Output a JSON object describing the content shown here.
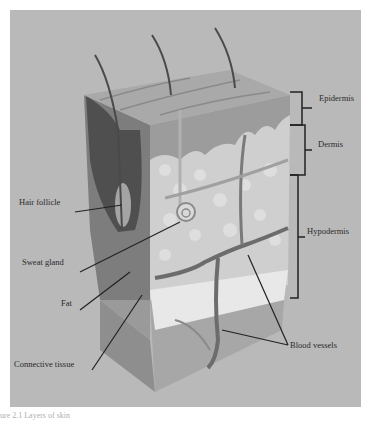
{
  "figure": {
    "caption": "ure 2.1 Layers of skin",
    "background_color": "#b9b9b9",
    "layers": [
      {
        "label": "Epidermis"
      },
      {
        "label": "Dermis"
      },
      {
        "label": "Hypodermis"
      }
    ],
    "structures": [
      {
        "label": "Hair follicle"
      },
      {
        "label": "Sweat gland"
      },
      {
        "label": "Fat"
      },
      {
        "label": "Connective tissue"
      },
      {
        "label": "Blood vessels"
      }
    ]
  }
}
